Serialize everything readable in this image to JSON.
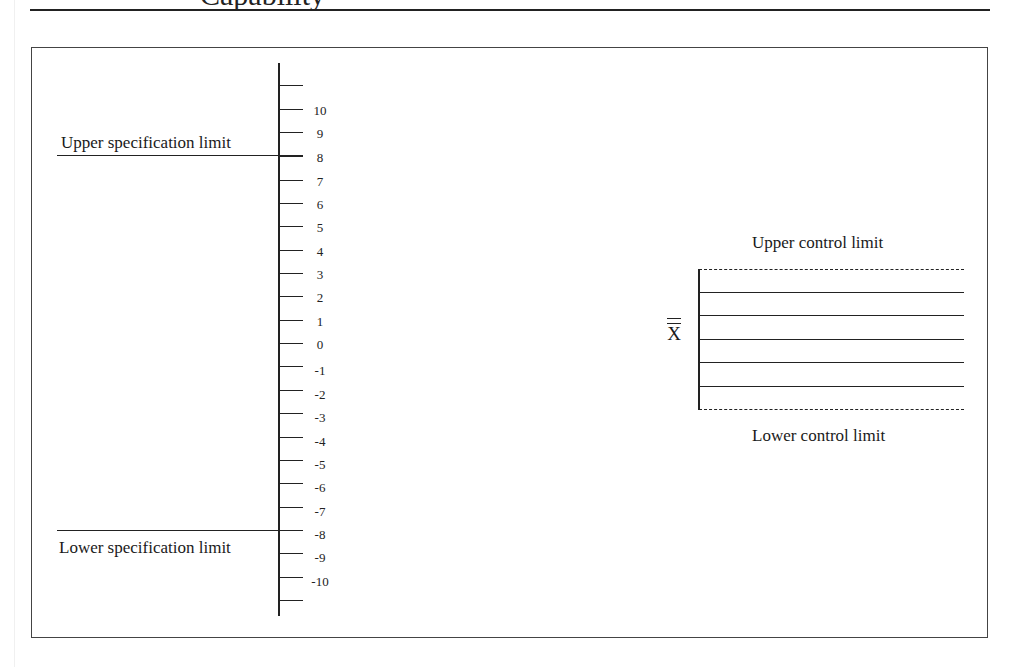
{
  "page": {
    "header_text": "Capability",
    "colors": {
      "ink": "#1a1a1a",
      "background": "#ffffff",
      "frame": "#444444"
    }
  },
  "diagram": {
    "left_scale": {
      "ticks": [
        {
          "label": "",
          "y": 85
        },
        {
          "label": "10",
          "y": 109
        },
        {
          "label": "9",
          "y": 132
        },
        {
          "label": "8",
          "y": 156
        },
        {
          "label": "7",
          "y": 180
        },
        {
          "label": "6",
          "y": 203
        },
        {
          "label": "5",
          "y": 226
        },
        {
          "label": "4",
          "y": 250
        },
        {
          "label": "3",
          "y": 273
        },
        {
          "label": "2",
          "y": 296
        },
        {
          "label": "1",
          "y": 320
        },
        {
          "label": "0",
          "y": 343
        },
        {
          "label": "-1",
          "y": 366
        },
        {
          "label": "-2",
          "y": 390
        },
        {
          "label": "-3",
          "y": 413
        },
        {
          "label": "-4",
          "y": 437
        },
        {
          "label": "-5",
          "y": 460
        },
        {
          "label": "-6",
          "y": 483
        },
        {
          "label": "-7",
          "y": 507
        },
        {
          "label": "-8",
          "y": 530
        },
        {
          "label": "-9",
          "y": 553
        },
        {
          "label": "-10",
          "y": 577
        },
        {
          "label": "",
          "y": 600
        }
      ],
      "upper_spec_label": "Upper specification limit",
      "upper_spec_value": 8,
      "lower_spec_label": "Lower specification limit",
      "lower_spec_value": -8
    },
    "control_chart": {
      "upper_label": "Upper control limit",
      "lower_label": "Lower control limit",
      "center_symbol": "X",
      "center_symbol_name": "X double bar (grand mean)",
      "solid_lines": 5,
      "dashed_lines": 2
    }
  }
}
